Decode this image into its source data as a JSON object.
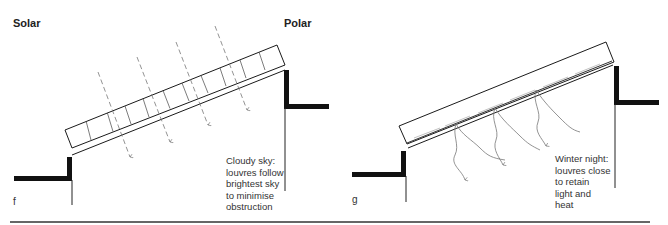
{
  "labels": {
    "solar": "Solar",
    "polar": "Polar"
  },
  "panels": [
    {
      "id": "f",
      "letter": "f",
      "caption": "Cloudy sky:\nlouvres follow\nbrightest sky\nto minimise\nobstruction",
      "louvre_state": "open, angled toward brightest sky",
      "rays": "diffuse light passing through louvres (dashed arrows)"
    },
    {
      "id": "g",
      "letter": "g",
      "caption": "Winter night:\nlouvres close\nto retain\nlight and\nheat",
      "louvre_state": "closed, flat",
      "rays": "heat radiating downward (wavy arrows)"
    }
  ],
  "colors": {
    "ink": "#1a1a1a",
    "wall": "#111111",
    "ray": "#777777",
    "rule": "#333333"
  }
}
